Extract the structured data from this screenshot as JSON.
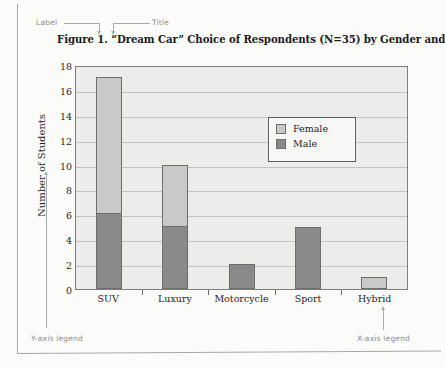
{
  "figure": {
    "title": "Figure 1.  “Dream Car” Choice of Respondents (N=35) by Gender and Type"
  },
  "annotations": [
    {
      "id": "label",
      "text": "Label"
    },
    {
      "id": "title",
      "text": "Title"
    },
    {
      "id": "bar-legend",
      "text": "Bar legend"
    },
    {
      "id": "y-axis-legend",
      "text": "Y-axis legend"
    },
    {
      "id": "x-axis-legend",
      "text": "X-axis legend"
    }
  ],
  "legend": {
    "entries": [
      {
        "label": "Female",
        "color": "#c9c9c9"
      },
      {
        "label": "Male",
        "color": "#8a8a8a"
      }
    ]
  },
  "chart_data": {
    "type": "bar",
    "title": "Figure 1.  “Dream Car” Choice of Respondents (N=35) by Gender and Type",
    "xlabel": "",
    "ylabel": "Number of Students",
    "categories": [
      "SUV",
      "Luxury",
      "Motorcycle",
      "Sport",
      "Hybrid"
    ],
    "series": [
      {
        "name": "Male",
        "color": "#8a8a8a",
        "values": [
          6,
          5,
          2,
          5,
          0
        ]
      },
      {
        "name": "Female",
        "color": "#c9c9c9",
        "values": [
          11,
          5,
          0,
          0,
          1
        ]
      }
    ],
    "totals": [
      17,
      10,
      2,
      5,
      1
    ],
    "stacked": true,
    "ylim": [
      0,
      18
    ],
    "yticks": [
      0,
      2,
      4,
      6,
      8,
      10,
      12,
      14,
      16,
      18
    ],
    "ytick_labels": [
      "0",
      "2",
      "4",
      "6",
      "8",
      "10",
      "12",
      "14",
      "16",
      "18"
    ],
    "grid": true,
    "legend_position": "inside-upper-right",
    "plot_background": "#ececeb"
  }
}
